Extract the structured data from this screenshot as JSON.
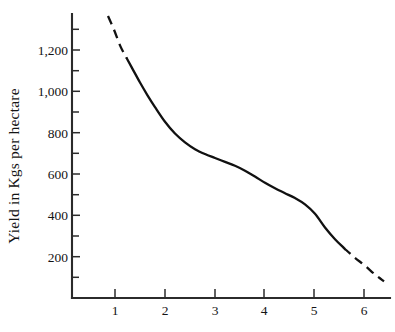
{
  "chart_data": {
    "type": "line",
    "title": "",
    "xlabel": "",
    "ylabel": "Yield in Kgs per hectare",
    "xlim": [
      0.14,
      6.5
    ],
    "ylim": [
      0,
      1450
    ],
    "grid": false,
    "legend": null,
    "x_ticks": [
      1,
      2,
      3,
      4,
      5,
      6
    ],
    "x_tick_labels": [
      "1",
      "2",
      "3",
      "4",
      "5",
      "6"
    ],
    "y_ticks": [
      200,
      400,
      600,
      800,
      1000,
      1200
    ],
    "y_tick_labels": [
      "200",
      "400",
      "600",
      "800",
      "1,000",
      "1,200"
    ],
    "y_minor_ticks": [
      100,
      300,
      500,
      700,
      900,
      1100,
      1300
    ],
    "series": [
      {
        "name": "yield",
        "style": "solid-with-dashed-extrapolation",
        "x": [
          0.86,
          0.98,
          1.1,
          1.2,
          1.35,
          1.5,
          1.65,
          1.8,
          2.0,
          2.2,
          2.4,
          2.6,
          2.8,
          3.0,
          3.2,
          3.4,
          3.6,
          3.8,
          4.0,
          4.2,
          4.4,
          4.6,
          4.8,
          5.0,
          5.2,
          5.4,
          5.6,
          5.8,
          6.0,
          6.2,
          6.38
        ],
        "y": [
          1440,
          1370,
          1290,
          1240,
          1170,
          1100,
          1035,
          975,
          900,
          840,
          795,
          760,
          735,
          715,
          695,
          675,
          650,
          620,
          588,
          560,
          535,
          510,
          478,
          430,
          360,
          300,
          250,
          205,
          165,
          120,
          85
        ]
      }
    ],
    "dashed_segments": [
      {
        "from_x": 0.86,
        "to_x": 1.24,
        "note": "upper extrapolation"
      },
      {
        "from_x": 5.58,
        "to_x": 6.38,
        "note": "lower extrapolation"
      }
    ]
  }
}
